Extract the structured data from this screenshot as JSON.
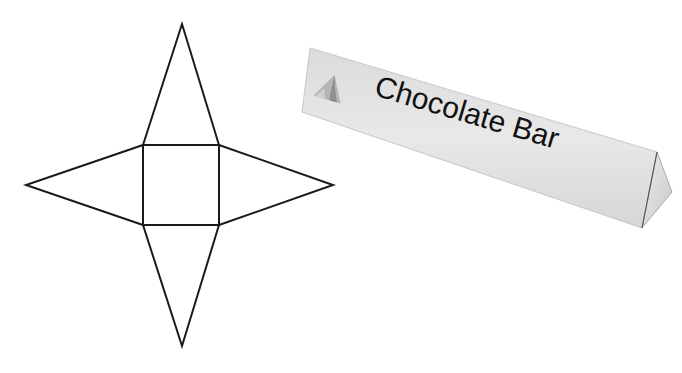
{
  "figure": {
    "net": {
      "description": "Net of a square pyramid",
      "square": {
        "x": 143,
        "y": 145,
        "w": 76,
        "h": 80
      },
      "apex_top": [
        182,
        24
      ],
      "apex_left": [
        26,
        185
      ],
      "apex_right": [
        333,
        185
      ],
      "apex_bottom": [
        182,
        346
      ],
      "stroke_color": "#1a1a1a"
    },
    "chocolate_bar": {
      "label": "Chocolate Bar",
      "logo_icon": "mountain-icon",
      "fill_color": "#e4e4e4",
      "text_color": "#111111"
    }
  }
}
